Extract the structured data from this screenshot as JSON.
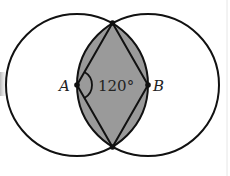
{
  "diagram": {
    "type": "geometry",
    "points": [
      {
        "id": "A",
        "label": "A",
        "x": 77,
        "y": 85
      },
      {
        "id": "B",
        "label": "B",
        "x": 148,
        "y": 85
      },
      {
        "id": "top",
        "label": "",
        "x": 112.5,
        "y": 23
      },
      {
        "id": "bottom",
        "label": "",
        "x": 112.5,
        "y": 147
      }
    ],
    "circles": [
      {
        "center": "A",
        "radius": 71
      },
      {
        "center": "B",
        "radius": 71
      }
    ],
    "angle": {
      "vertex": "A",
      "label": "120°",
      "value_degrees": 120
    },
    "colors": {
      "stroke": "#111111",
      "shade": "#9a9a9a",
      "background": "#ffffff"
    }
  },
  "labels": {
    "point_a": "A",
    "point_b": "B",
    "angle": "120°"
  }
}
